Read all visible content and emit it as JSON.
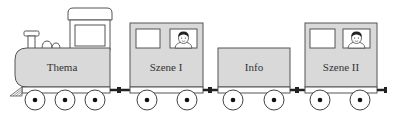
{
  "diagram": {
    "type": "train",
    "colors": {
      "car_body": "#d9d9d9",
      "outline": "#555555",
      "window": "#ffffff",
      "coupler": "#222222"
    },
    "cars": [
      {
        "id": "locomotive",
        "label": "Thema",
        "kind": "locomotive",
        "passenger": false
      },
      {
        "id": "wagon-1",
        "label": "Szene I",
        "kind": "passenger-car",
        "passenger": true
      },
      {
        "id": "wagon-2",
        "label": "Info",
        "kind": "freight-car",
        "passenger": false
      },
      {
        "id": "wagon-3",
        "label": "Szene II",
        "kind": "passenger-car",
        "passenger": true
      }
    ]
  }
}
